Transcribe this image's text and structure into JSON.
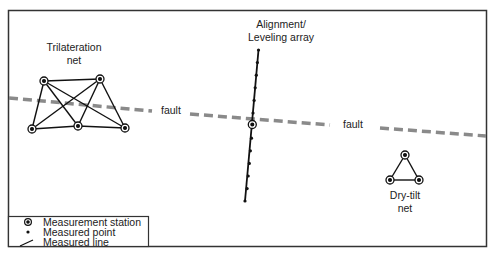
{
  "diagram": {
    "labels": {
      "trilateration": [
        "Trilateration",
        "net"
      ],
      "alignment": [
        "Alignment/",
        "Leveling array"
      ],
      "drytilt": [
        "Dry-tilt",
        "net"
      ],
      "fault_left": "fault",
      "fault_right": "fault"
    },
    "legend": {
      "items": [
        {
          "icon": "measurement-station-icon",
          "label": "Measurement station"
        },
        {
          "icon": "measured-point-icon",
          "label": "Measured point"
        },
        {
          "icon": "measured-line-icon",
          "label": "Measured line"
        }
      ]
    },
    "colors": {
      "frame": "#333333",
      "ink": "#111111",
      "fault": "#8a8a8a"
    }
  }
}
